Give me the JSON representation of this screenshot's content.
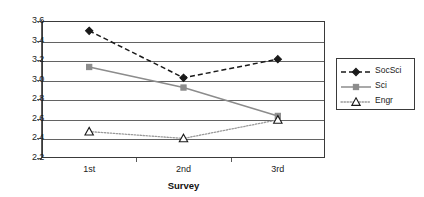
{
  "chart_data": {
    "type": "line",
    "title": "",
    "xlabel": "Survey",
    "ylabel": "",
    "categories": [
      "1st",
      "2nd",
      "3rd"
    ],
    "ylim": [
      2.2,
      3.6
    ],
    "yticks": [
      "3.6",
      "3.4",
      "3.2",
      "3.0",
      "2.8",
      "2.6",
      "2.4",
      "2.2"
    ],
    "ytick_values": [
      3.6,
      3.4,
      3.2,
      3.0,
      2.8,
      2.6,
      2.4,
      2.2
    ],
    "grid": true,
    "legend_position": "right",
    "series": [
      {
        "name": "SocSci",
        "values": [
          3.5,
          3.02,
          3.21
        ],
        "color": "#1a1a1a",
        "line_style": "dashed",
        "marker": "diamond",
        "marker_fill": "#1a1a1a"
      },
      {
        "name": "Sci",
        "values": [
          3.13,
          2.92,
          2.63
        ],
        "color": "#8c8c8c",
        "line_style": "solid",
        "marker": "square",
        "marker_fill": "#8c8c8c"
      },
      {
        "name": "Engr",
        "values": [
          2.47,
          2.4,
          2.59
        ],
        "color": "#9a9a9a",
        "line_style": "dotted",
        "marker": "triangle",
        "marker_fill": "#ffffff"
      }
    ]
  },
  "legend": {
    "items": [
      {
        "label": "SocSci"
      },
      {
        "label": "Sci"
      },
      {
        "label": "Engr"
      }
    ]
  }
}
